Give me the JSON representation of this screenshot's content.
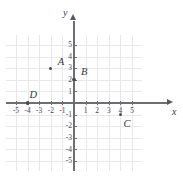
{
  "chart_data": {
    "type": "scatter",
    "title": "",
    "xlabel": "x",
    "ylabel": "y",
    "xlim": [
      -6,
      6
    ],
    "ylim": [
      -6,
      6
    ],
    "grid": true,
    "legend": "none",
    "x_ticks": [
      -5,
      -4,
      -3,
      -2,
      -1,
      1,
      2,
      3,
      4,
      5
    ],
    "y_ticks": [
      -5,
      -4,
      -3,
      -2,
      -1,
      1,
      2,
      3,
      4,
      5
    ],
    "x_tick_labels": [
      "-5",
      "-4",
      "-3",
      "-2",
      "-1",
      "1",
      "2",
      "3",
      "4",
      "5"
    ],
    "y_tick_labels": [
      "-5",
      "-4",
      "-3",
      "-2",
      "-1",
      "1",
      "2",
      "3",
      "4",
      "5"
    ],
    "points": [
      {
        "label": "A",
        "x": -2,
        "y": 3,
        "label_dx": 7,
        "label_dy": -11
      },
      {
        "label": "B",
        "x": 0,
        "y": 2,
        "label_dx": 7,
        "label_dy": -13
      },
      {
        "label": "C",
        "x": 4,
        "y": -1,
        "label_dx": 3,
        "label_dy": 4
      },
      {
        "label": "D",
        "x": -4,
        "y": 0,
        "label_dx": 2,
        "label_dy": -13
      }
    ]
  },
  "axes": {
    "x_axis_label": "x",
    "y_axis_label": "y",
    "x_arrow_icon": "arrow-right-icon",
    "y_arrow_icon": "arrow-up-icon"
  }
}
